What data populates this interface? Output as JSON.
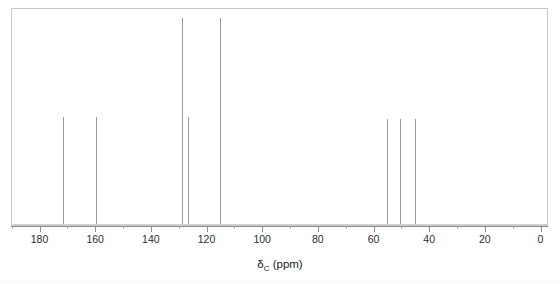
{
  "figure": {
    "type": "nmr-spectrum",
    "background_color": "#ffffff",
    "frame_color": "#c8c8c8",
    "peak_color": "#9a9a9a",
    "axis_color": "#8c8c8c"
  },
  "axis": {
    "title_delta": "δ",
    "title_sub": "C",
    "title_unit": " (ppm)",
    "title_full": "δC (ppm)",
    "orientation": "reversed",
    "min": 0,
    "max": 190,
    "major_step": 20,
    "minor_step": 10,
    "major_ticks": [
      {
        "value": 180,
        "label": "180"
      },
      {
        "value": 160,
        "label": "160"
      },
      {
        "value": 140,
        "label": "140"
      },
      {
        "value": 120,
        "label": "120"
      },
      {
        "value": 100,
        "label": "100"
      },
      {
        "value": 80,
        "label": "80"
      },
      {
        "value": 60,
        "label": "60"
      },
      {
        "value": 40,
        "label": "40"
      },
      {
        "value": 20,
        "label": "20"
      },
      {
        "value": 0,
        "label": "0"
      }
    ],
    "minor_ticks": [
      190,
      170,
      150,
      130,
      110,
      90,
      70,
      50,
      30,
      10
    ]
  },
  "chart_data": {
    "type": "line",
    "title": "",
    "subtitle": "",
    "xlabel": "δC (ppm)",
    "ylabel": "",
    "xlim": [
      190,
      0
    ],
    "ylim": [
      0,
      100
    ],
    "grid": false,
    "legend": "none",
    "x": [
      172.0,
      160.0,
      129.0,
      127.0,
      115.5,
      55.5,
      51.0,
      45.5
    ],
    "values": [
      50,
      50,
      96,
      50,
      96,
      49,
      49,
      49
    ],
    "peaks": [
      {
        "ppm": 172.0,
        "intensity": 50,
        "label": ""
      },
      {
        "ppm": 160.0,
        "intensity": 50,
        "label": ""
      },
      {
        "ppm": 129.0,
        "intensity": 96,
        "label": ""
      },
      {
        "ppm": 127.0,
        "intensity": 50,
        "label": ""
      },
      {
        "ppm": 115.5,
        "intensity": 96,
        "label": ""
      },
      {
        "ppm": 55.5,
        "intensity": 49,
        "label": ""
      },
      {
        "ppm": 51.0,
        "intensity": 49,
        "label": ""
      },
      {
        "ppm": 45.5,
        "intensity": 49,
        "label": ""
      }
    ]
  }
}
